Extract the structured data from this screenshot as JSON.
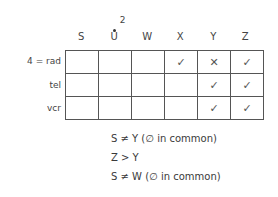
{
  "grid": {
    "columns": [
      "S",
      "U",
      "W",
      "X",
      "Y",
      "Z"
    ],
    "column_notes": {
      "U": "2"
    },
    "rows": [
      {
        "label": "4 = rad",
        "cells": [
          "",
          "",
          "",
          "✓",
          "✕",
          "✓"
        ]
      },
      {
        "label": "tel",
        "cells": [
          "",
          "",
          "",
          "",
          "✓",
          "✓"
        ]
      },
      {
        "label": "vcr",
        "cells": [
          "",
          "",
          "",
          "",
          "✓",
          "✓"
        ]
      }
    ]
  },
  "clues": [
    "S ≠ Y (∅ in common)",
    "Z > Y",
    "S ≠ W (∅ in common)"
  ],
  "colors": {
    "ink": "#3a3a3a",
    "grid_line": "#555555",
    "background": "#ffffff"
  }
}
